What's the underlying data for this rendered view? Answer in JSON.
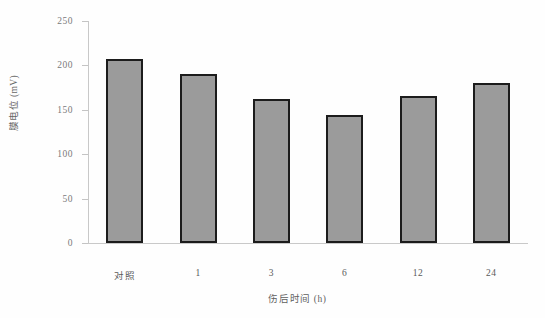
{
  "chart_data": {
    "type": "bar",
    "title": "",
    "xlabel": "伤后时间 (h)",
    "ylabel": "膜电位 (mV)",
    "categories": [
      "对照",
      "1",
      "3",
      "6",
      "12",
      "24"
    ],
    "values": [
      207,
      190,
      162,
      144,
      166,
      180
    ],
    "ylim": [
      0,
      250
    ],
    "yticks": [
      0,
      50,
      100,
      150,
      200,
      250
    ],
    "ytick_labels": [
      "0",
      "50",
      "100",
      "150",
      "200",
      "250"
    ],
    "grid": false,
    "legend": null,
    "bar_fill_color": "#9b9b9b",
    "bar_edge_color": "#1c1c1c",
    "axis_color": "#c8c8c8",
    "background_color": "#ffffff"
  }
}
